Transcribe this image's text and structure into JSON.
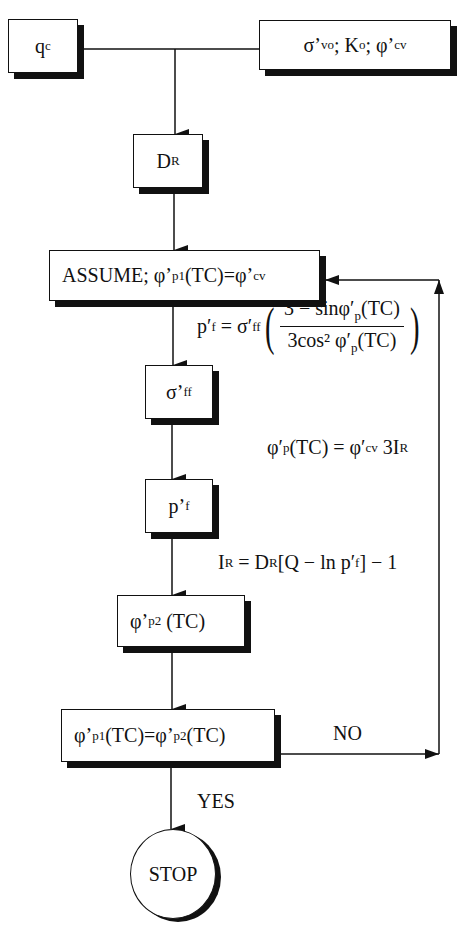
{
  "diagram": {
    "type": "flowchart",
    "inputs": {
      "qc": {
        "main": "q",
        "sub": "c"
      },
      "state": {
        "sigma": "σ’",
        "sigma_sub": "vo",
        "sep1": "; K",
        "k_sub": "o",
        "sep2": "; φ’",
        "phi_sub": "cv"
      }
    },
    "nodes": {
      "dr": {
        "main": "D",
        "sub": "R"
      },
      "assume": {
        "prefix": "ASSUME; φ’",
        "sub1": "p1",
        "mid": "(TC)=φ’",
        "sub2": "cv"
      },
      "sigma_ff": {
        "main": "σ’",
        "sub": "ff"
      },
      "p_f": {
        "main": "p’",
        "sub": "f"
      },
      "phi_p2": {
        "main": "φ’",
        "sub": "p2",
        "suffix": " (TC)"
      },
      "decision": {
        "a": "φ’",
        "a_sub": "p1",
        "mid": "(TC)=φ’",
        "b_sub": "p2",
        "suffix": "(TC)"
      },
      "stop": "STOP"
    },
    "equations": {
      "eq1": {
        "lhs": "p′",
        "lhs_sub": "f",
        "eq": " = σ′",
        "eq_sub": "ff",
        "num": "3 − sinφ′",
        "num_sub": "p",
        "num_tail": "(TC)",
        "den": "3cos² φ′",
        "den_sub": "p",
        "den_tail": "(TC)"
      },
      "eq2": {
        "lhs": "φ′",
        "lhs_sub": "p",
        "mid": "(TC) = φ′",
        "mid_sub": "cv",
        "tail": " 3I",
        "tail_sub": "R"
      },
      "eq3": {
        "lhs": "I",
        "lhs_sub": "R",
        "mid": " = D",
        "mid_sub": "R",
        "bracket": "[Q − ln p′",
        "bracket_sub": "f",
        "tail": "] − 1"
      }
    },
    "edge_labels": {
      "no": "NO",
      "yes": "YES"
    }
  }
}
